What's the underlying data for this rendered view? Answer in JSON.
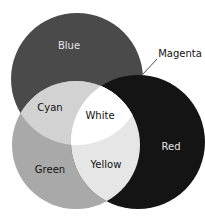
{
  "diagram": {
    "type": "venn",
    "title": "",
    "circles": [
      {
        "name": "Blue",
        "cx": 77,
        "cy": 79,
        "r": 66,
        "fill": "#4a4a4a"
      },
      {
        "name": "Green",
        "cx": 76,
        "cy": 145,
        "r": 64,
        "fill": "#a9a9a9"
      },
      {
        "name": "Red",
        "cx": 138,
        "cy": 142,
        "r": 67,
        "fill": "#141414"
      }
    ],
    "labels": {
      "blue": "Blue",
      "magenta": "Magenta",
      "cyan": "Cyan",
      "white": "White",
      "red": "Red",
      "green": "Green",
      "yellow": "Yellow"
    },
    "region_fills": {
      "cyan": "#d2d2d2",
      "white": "#ffffff",
      "yellow": "#e6e6e6",
      "magenta": "#141414"
    }
  }
}
